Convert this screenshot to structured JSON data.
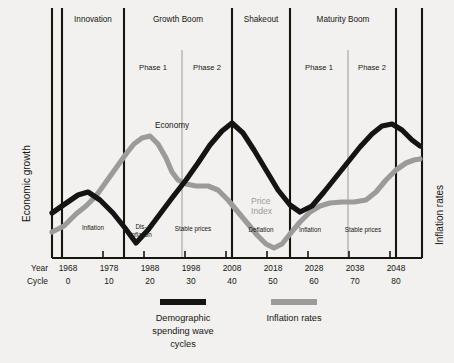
{
  "chart_data": {
    "type": "line",
    "title": "",
    "xlabel": "",
    "ylabel_left": "Economic growth",
    "ylabel_right": "Inflation rates",
    "grid": false,
    "legend_position": "bottom",
    "x_axis": {
      "row_labels": [
        "Year",
        "Cycle"
      ],
      "year_ticks": [
        "1968",
        "1978",
        "1988",
        "1998",
        "2008",
        "2018",
        "2028",
        "2038",
        "2048"
      ],
      "cycle_ticks": [
        "0",
        "10",
        "20",
        "30",
        "40",
        "50",
        "60",
        "70",
        "80"
      ]
    },
    "eras": [
      {
        "label": "Innovation"
      },
      {
        "label": "Growth Boom"
      },
      {
        "label": "Shakeout"
      },
      {
        "label": "Maturity Boom"
      }
    ],
    "phases": [
      {
        "label": "Phase 1",
        "era": "Growth Boom"
      },
      {
        "label": "Phase 2",
        "era": "Growth Boom"
      },
      {
        "label": "Phase 1",
        "era": "Maturity Boom"
      },
      {
        "label": "Phase 2",
        "era": "Maturity Boom"
      }
    ],
    "inline_annotations": [
      {
        "label": "Inflation"
      },
      {
        "label": "Dis-"
      },
      {
        "label": "inflation"
      },
      {
        "label": "Stable prices"
      },
      {
        "label": "Deflation"
      },
      {
        "label": "Inflation"
      },
      {
        "label": "Stable prices"
      }
    ],
    "curve_labels": [
      {
        "label": "Economy",
        "color": "#141414"
      },
      {
        "label": "Price",
        "color": "#9b9b99"
      },
      {
        "label": "Index",
        "color": "#9b9b99"
      }
    ],
    "series": [
      {
        "name": "Demographic spending wave cycles",
        "color": "#141414",
        "points": [
          [
            52,
            213
          ],
          [
            62,
            206
          ],
          [
            78,
            195
          ],
          [
            88,
            192
          ],
          [
            100,
            200
          ],
          [
            113,
            213
          ],
          [
            125,
            228
          ],
          [
            136,
            243
          ],
          [
            148,
            230
          ],
          [
            160,
            214
          ],
          [
            172,
            198
          ],
          [
            186,
            180
          ],
          [
            198,
            163
          ],
          [
            210,
            145
          ],
          [
            222,
            131
          ],
          [
            232,
            123
          ],
          [
            243,
            133
          ],
          [
            254,
            150
          ],
          [
            266,
            170
          ],
          [
            278,
            190
          ],
          [
            290,
            205
          ],
          [
            300,
            212
          ],
          [
            312,
            206
          ],
          [
            324,
            192
          ],
          [
            336,
            177
          ],
          [
            348,
            162
          ],
          [
            360,
            147
          ],
          [
            372,
            134
          ],
          [
            382,
            126
          ],
          [
            392,
            124
          ],
          [
            402,
            130
          ],
          [
            412,
            140
          ],
          [
            420,
            146
          ]
        ]
      },
      {
        "name": "Inflation rates",
        "color": "#9b9b99",
        "points": [
          [
            52,
            232
          ],
          [
            64,
            226
          ],
          [
            76,
            214
          ],
          [
            86,
            206
          ],
          [
            96,
            196
          ],
          [
            106,
            182
          ],
          [
            116,
            168
          ],
          [
            126,
            154
          ],
          [
            134,
            144
          ],
          [
            142,
            138
          ],
          [
            150,
            136
          ],
          [
            158,
            144
          ],
          [
            166,
            158
          ],
          [
            172,
            172
          ],
          [
            178,
            180
          ],
          [
            186,
            184
          ],
          [
            196,
            186
          ],
          [
            208,
            186
          ],
          [
            218,
            190
          ],
          [
            228,
            200
          ],
          [
            238,
            212
          ],
          [
            248,
            224
          ],
          [
            258,
            236
          ],
          [
            266,
            244
          ],
          [
            274,
            248
          ],
          [
            282,
            244
          ],
          [
            290,
            234
          ],
          [
            300,
            222
          ],
          [
            310,
            212
          ],
          [
            320,
            206
          ],
          [
            330,
            203
          ],
          [
            342,
            202
          ],
          [
            354,
            202
          ],
          [
            366,
            200
          ],
          [
            376,
            192
          ],
          [
            386,
            180
          ],
          [
            396,
            170
          ],
          [
            406,
            163
          ],
          [
            414,
            160
          ],
          [
            420,
            159
          ]
        ]
      }
    ],
    "colors": {
      "black_series": "#141414",
      "gray_series": "#9b9b99",
      "background": "#f2f1ef",
      "axis": "#16160f",
      "thin_divider": "#8a8a88"
    }
  },
  "legend": [
    {
      "label_line1": "Demographic",
      "label_line2": "spending wave",
      "label_line3": "cycles",
      "color": "#141414"
    },
    {
      "label_line1": "Inflation rates",
      "label_line2": "",
      "label_line3": "",
      "color": "#9b9b99"
    }
  ]
}
